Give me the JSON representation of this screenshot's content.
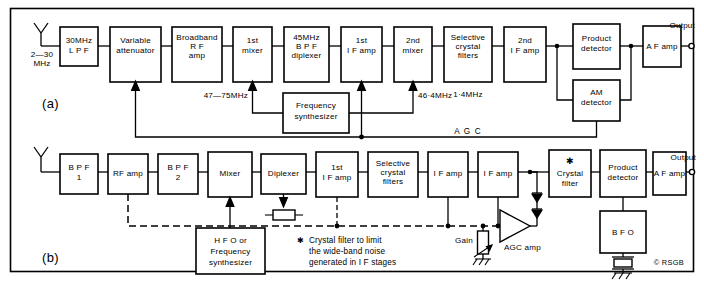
{
  "figure": {
    "copyright": "© RSGB",
    "panels": [
      {
        "id": "a",
        "label": "(a)"
      },
      {
        "id": "b",
        "label": "(b)"
      }
    ]
  },
  "diagram_a": {
    "panel_label": "(a)",
    "input_label_line1": "2—30",
    "input_label_line2": "MHz",
    "output_label": "Output",
    "agc_label": "A G C",
    "blocks": [
      {
        "id": "lpf",
        "lines": [
          "30MHz",
          "L P F"
        ]
      },
      {
        "id": "atten",
        "lines": [
          "Variable",
          "attenuator"
        ]
      },
      {
        "id": "rfamp",
        "lines": [
          "Broadband",
          "R F",
          "amp"
        ]
      },
      {
        "id": "mixer1",
        "lines": [
          "1st",
          "mixer"
        ]
      },
      {
        "id": "bpf",
        "lines": [
          "45MHz",
          "B P F",
          "diplexer"
        ]
      },
      {
        "id": "ifamp1",
        "lines": [
          "1st",
          "I F amp"
        ]
      },
      {
        "id": "mixer2",
        "lines": [
          "2nd",
          "mixer"
        ]
      },
      {
        "id": "xtalfilt",
        "lines": [
          "Selective",
          "crystal",
          "filters"
        ]
      },
      {
        "id": "ifamp2",
        "lines": [
          "2nd",
          "I F amp"
        ]
      },
      {
        "id": "proddet",
        "lines": [
          "Product",
          "detector"
        ]
      },
      {
        "id": "afamp",
        "lines": [
          "A F amp"
        ]
      },
      {
        "id": "synth",
        "lines": [
          "Frequency",
          "synthesizer"
        ]
      },
      {
        "id": "amdet",
        "lines": [
          "AM",
          "detector"
        ]
      }
    ],
    "annotations": [
      {
        "id": "lo1",
        "text": "47—75MHz"
      },
      {
        "id": "lo2",
        "text": "46·4MHz"
      },
      {
        "id": "if2",
        "text": "1·4MHz"
      }
    ]
  },
  "diagram_b": {
    "panel_label": "(b)",
    "output_label": "Output",
    "gain_label": "Gain",
    "agc_amp_label": "AGC amp",
    "star_glyph": "✱",
    "footnote": {
      "marker": "✱",
      "line1": "Crystal  filter  to limit",
      "line2": "the wide-band noise",
      "line3": "generated in I F stages"
    },
    "blocks": [
      {
        "id": "bpf1",
        "lines": [
          "B P F",
          "1"
        ]
      },
      {
        "id": "rfamp",
        "lines": [
          "RF amp"
        ]
      },
      {
        "id": "bpf2",
        "lines": [
          "B P F",
          "2"
        ]
      },
      {
        "id": "mixer",
        "lines": [
          "Mixer"
        ]
      },
      {
        "id": "diplexer",
        "lines": [
          "Diplexer"
        ]
      },
      {
        "id": "ifamp1",
        "lines": [
          "1st",
          "I F amp"
        ]
      },
      {
        "id": "xtalfilt",
        "lines": [
          "Selective",
          "crystal",
          "filters"
        ]
      },
      {
        "id": "ifamp2",
        "lines": [
          "I F amp"
        ]
      },
      {
        "id": "ifamp3",
        "lines": [
          "I F amp"
        ]
      },
      {
        "id": "xtal",
        "lines": [
          "✱",
          "Crystal",
          "filter"
        ]
      },
      {
        "id": "proddet",
        "lines": [
          "Product",
          "detector"
        ]
      },
      {
        "id": "afamp",
        "lines": [
          "A F amp"
        ]
      },
      {
        "id": "hfo",
        "lines": [
          "H F O  or",
          "Frequency",
          "synthesizer"
        ]
      },
      {
        "id": "bfo",
        "lines": [
          "B F O"
        ]
      }
    ]
  }
}
